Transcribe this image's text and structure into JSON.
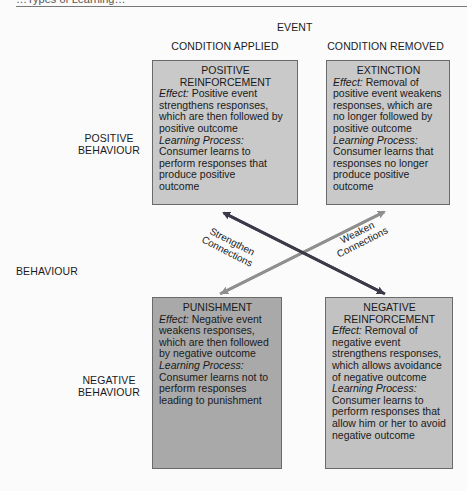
{
  "header": {
    "partial_title": "…Types of Learning…"
  },
  "axes": {
    "event_label": "EVENT",
    "columns": [
      "CONDITION APPLIED",
      "CONDITION REMOVED"
    ],
    "behaviour_label": "BEHAVIOUR",
    "rows": [
      {
        "line1": "POSITIVE",
        "line2": "BEHAVIOUR"
      },
      {
        "line1": "NEGATIVE",
        "line2": "BEHAVIOUR"
      }
    ]
  },
  "quadrants": {
    "positive_reinforcement": {
      "title_line1": "POSITIVE",
      "title_line2": "REINFORCEMENT",
      "effect_label": "Effect:",
      "effect_text": " Positive event strengthens responses, which are then followed by positive outcome",
      "learning_label": "Learning Process:",
      "learning_text": "Consumer learns to perform responses that produce positive outcome",
      "fill": "#c9c9c9"
    },
    "extinction": {
      "title_line1": "EXTINCTION",
      "effect_label": "Effect:",
      "effect_text": " Removal of positive event weakens responses, which are no longer followed by positive outcome",
      "learning_label": "Learning Process:",
      "learning_text": "Consumer learns that responses no longer produce positive outcome",
      "fill": "#c9c9c9"
    },
    "punishment": {
      "title_line1": "PUNISHMENT",
      "effect_label": "Effect:",
      "effect_text": " Negative event weakens responses, which are then followed by negative outcome",
      "learning_label": "Learning Process:",
      "learning_text": "Consumer learns not to perform responses leading to punishment",
      "fill": "#a9a9a9"
    },
    "negative_reinforcement": {
      "title_line1": "NEGATIVE",
      "title_line2": "REINFORCEMENT",
      "effect_label": "Effect:",
      "effect_text": " Removal of negative event strengthens responses, which allows avoidance of negative outcome",
      "learning_label": "Learning Process:",
      "learning_text": "Consumer learns to perform responses that allow him or her to avoid negative outcome",
      "fill": "#c2c2c2"
    }
  },
  "connections": {
    "strengthen": {
      "line1": "Strengthen",
      "line2": "Connections",
      "color": "#3a3a4a"
    },
    "weaken": {
      "line1": "Weaken",
      "line2": "Connections",
      "color": "#8f8f8f"
    }
  }
}
